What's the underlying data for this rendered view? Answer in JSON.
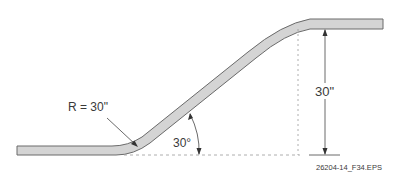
{
  "diagram": {
    "labels": {
      "radius": "R = 30\"",
      "angle": "30°",
      "height": "30\"",
      "figure_id": "26204-14_F34.EPS"
    },
    "colors": {
      "bar_fill": "#d4d4d4",
      "bar_stroke": "#6a6a6a",
      "line": "#444444",
      "dashed": "#9a9a9a"
    }
  }
}
